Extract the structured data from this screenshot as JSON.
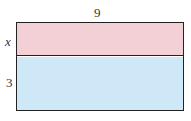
{
  "diagram": {
    "top_label": "9",
    "left_labels": {
      "top_section": "x",
      "bottom_section": "3"
    },
    "sections": [
      {
        "name": "top",
        "height_label": "x",
        "color": "#f2d0d6"
      },
      {
        "name": "bottom",
        "height_label": "3",
        "color": "#cfe8f8"
      }
    ],
    "border_color": "#222222"
  }
}
